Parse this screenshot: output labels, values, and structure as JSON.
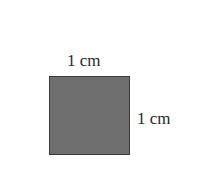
{
  "diagram": {
    "shape": "square",
    "fill_color": "#6e6e6e",
    "border_color": "#3a3a3a",
    "labels": {
      "top": "1 cm",
      "right": "1 cm"
    }
  }
}
